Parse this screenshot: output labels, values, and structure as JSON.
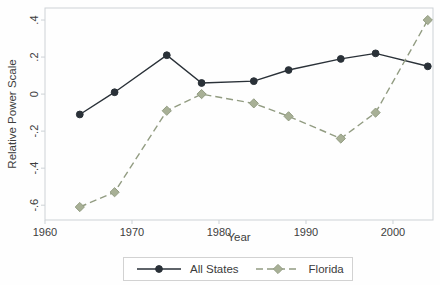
{
  "figure": {
    "type_note": "statistical line chart, white background, framed plot area, legend below x-axis"
  },
  "colors": {
    "background": "#fefefe",
    "frame": "#cdd2d6",
    "tick_text": "#3d3d3d",
    "axis_title_text": "#3d3d3d",
    "legend_border": "#d2d2d2",
    "all_states": "#2a3138",
    "florida": "#929c82",
    "florida_marker_fill": "#a8b096"
  },
  "chart_data": {
    "type": "line",
    "title": "",
    "xlabel": "Year",
    "ylabel": "Relative Power Scale",
    "x": [
      1964,
      1968,
      1974,
      1978,
      1984,
      1988,
      1994,
      1998,
      2004
    ],
    "series": [
      {
        "name": "All States",
        "values": [
          -0.11,
          0.01,
          0.21,
          0.06,
          0.07,
          0.13,
          0.19,
          0.22,
          0.15
        ],
        "line": "solid",
        "marker": "circle",
        "color": "#2a3138",
        "marker_fill": "#2a3138"
      },
      {
        "name": "Florida",
        "values": [
          -0.61,
          -0.53,
          -0.09,
          0.0,
          -0.05,
          -0.12,
          -0.24,
          -0.1,
          0.4
        ],
        "line": "dashed",
        "marker": "diamond",
        "color": "#929c82",
        "marker_fill": "#a8b096"
      }
    ],
    "xticks": [
      1960,
      1970,
      1980,
      1990,
      2000
    ],
    "yticks": [
      0.4,
      0.2,
      0,
      -0.2,
      -0.4,
      -0.6
    ],
    "ytick_labels": [
      ".4",
      ".2",
      "0",
      "-.2",
      "-.4",
      "-.6"
    ],
    "xlim": [
      1960,
      2004.6
    ],
    "ylim": [
      -0.68,
      0.465
    ],
    "grid": false,
    "legend_position": "bottom-center",
    "ytick_label_rotation": -90
  }
}
